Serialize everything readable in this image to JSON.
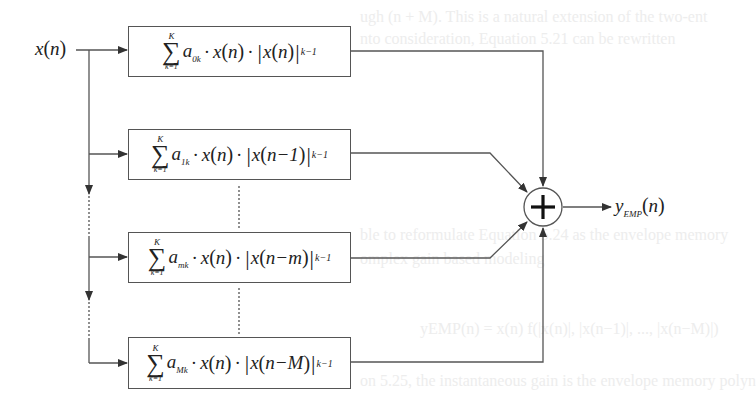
{
  "diagram": {
    "type": "block-diagram",
    "title": "",
    "input": {
      "var": "x",
      "arg": "n"
    },
    "output": {
      "var": "y",
      "subscript": "EMP",
      "arg": "n"
    },
    "summer": {
      "symbol": "+"
    },
    "branches": [
      {
        "sum_upper": "K",
        "sum_lower": "k=1",
        "sigma": "∑",
        "coef": "a",
        "coef_sub": "0k",
        "x_term": "x",
        "x_arg": "n",
        "abs_arg": "n",
        "exponent": "k−1",
        "dot": "·",
        "abs_bar": "|"
      },
      {
        "sum_upper": "K",
        "sum_lower": "k=1",
        "sigma": "∑",
        "coef": "a",
        "coef_sub": "1k",
        "x_term": "x",
        "x_arg": "n",
        "abs_arg": "n−1",
        "exponent": "k−1",
        "dot": "·",
        "abs_bar": "|"
      },
      {
        "sum_upper": "K",
        "sum_lower": "k=1",
        "sigma": "∑",
        "coef": "a",
        "coef_sub": "mk",
        "x_term": "x",
        "x_arg": "n",
        "abs_arg": "n−m",
        "exponent": "k−1",
        "dot": "·",
        "abs_bar": "|"
      },
      {
        "sum_upper": "K",
        "sum_lower": "k=1",
        "sigma": "∑",
        "coef": "a",
        "coef_sub": "Mk",
        "x_term": "x",
        "x_arg": "n",
        "abs_arg": "n−M",
        "exponent": "k−1",
        "dot": "·",
        "abs_bar": "|"
      }
    ],
    "colors": {
      "line": "#555555",
      "text": "#222222",
      "background_text": "#ededed"
    }
  },
  "background_text": [
    "ugh (n + M). This is a natural extension of the two-ent",
    "nto consideration, Equation 5.21 can be rewritten",
    "ble to reformulate Equation 5.24 as the envelope memory",
    "omplex gain based modeling",
    "yEMP(n) = x(n) f(|x(n)|, |x(n−1)|, ..., |x(n−M)|)",
    "on 5.25, the instantaneous gain is the envelope memory polyn"
  ]
}
